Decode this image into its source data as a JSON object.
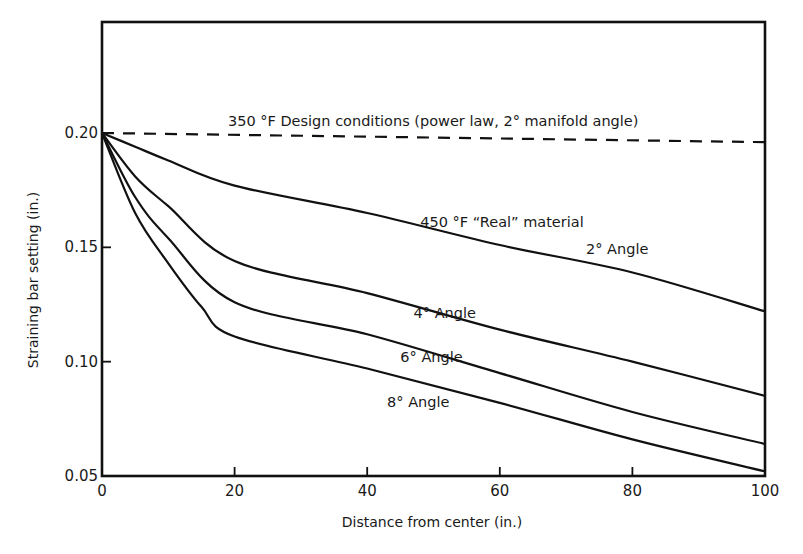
{
  "chart_data": {
    "type": "line",
    "title": "",
    "xlabel": "Distance from center (in.)",
    "ylabel": "Straining bar setting (in.)",
    "xlim": [
      0,
      100
    ],
    "ylim": [
      0.05,
      0.2
    ],
    "ylim_frame_top": 0.245,
    "grid": false,
    "legend": "none (inline curve annotations)",
    "x_ticks": [
      0,
      20,
      40,
      60,
      80,
      100
    ],
    "x_tick_labels": [
      "0",
      "20",
      "40",
      "60",
      "80",
      "100"
    ],
    "y_ticks": [
      0.05,
      0.1,
      0.15,
      0.2
    ],
    "y_tick_labels": [
      "0.05",
      "0.10",
      "0.15",
      "0.20"
    ],
    "series": [
      {
        "name": "350 °F Design conditions (power law, 2° manifold angle)",
        "style": "dashed",
        "x": [
          0,
          100
        ],
        "y": [
          0.2,
          0.196
        ]
      },
      {
        "name": "450 °F \"Real\" material, 2° Angle",
        "style": "solid",
        "x": [
          0,
          5,
          10,
          20,
          40,
          60,
          80,
          100
        ],
        "y": [
          0.2,
          0.194,
          0.188,
          0.177,
          0.165,
          0.151,
          0.139,
          0.122
        ]
      },
      {
        "name": "4° Angle",
        "style": "solid",
        "x": [
          0,
          5,
          10,
          20,
          40,
          60,
          80,
          100
        ],
        "y": [
          0.2,
          0.181,
          0.168,
          0.144,
          0.13,
          0.114,
          0.1,
          0.085
        ]
      },
      {
        "name": "6° Angle",
        "style": "solid",
        "x": [
          0,
          5,
          10,
          20,
          40,
          60,
          80,
          100
        ],
        "y": [
          0.2,
          0.172,
          0.154,
          0.126,
          0.112,
          0.095,
          0.078,
          0.064
        ]
      },
      {
        "name": "8° Angle",
        "style": "solid",
        "x": [
          0,
          5,
          10,
          15,
          20,
          40,
          60,
          80,
          100
        ],
        "y": [
          0.2,
          0.165,
          0.143,
          0.124,
          0.111,
          0.097,
          0.082,
          0.066,
          0.052
        ]
      }
    ],
    "annotations": [
      {
        "text": "350 °F Design conditions (power law, 2° manifold angle)",
        "near_series": 0,
        "x": 19,
        "y": 0.203
      },
      {
        "text": "450 °F “Real” material",
        "near_series": 1,
        "x": 48,
        "y": 0.159
      },
      {
        "text": "2° Angle",
        "near_series": 1,
        "x": 73,
        "y": 0.147
      },
      {
        "text": "4° Angle",
        "near_series": 2,
        "x": 47,
        "y": 0.119
      },
      {
        "text": "6° Angle",
        "near_series": 3,
        "x": 45,
        "y": 0.1
      },
      {
        "text": "8° Angle",
        "near_series": 4,
        "x": 43,
        "y": 0.08
      }
    ]
  }
}
